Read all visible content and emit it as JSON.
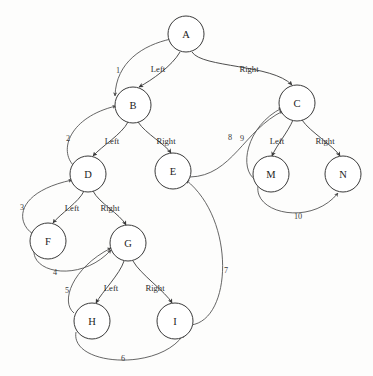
{
  "diagram": {
    "type": "binary-tree-traversal",
    "radius": 18,
    "nodes": [
      {
        "id": "A",
        "label": "A",
        "x": 186,
        "y": 34
      },
      {
        "id": "B",
        "label": "B",
        "x": 133,
        "y": 105
      },
      {
        "id": "C",
        "label": "C",
        "x": 297,
        "y": 103
      },
      {
        "id": "D",
        "label": "D",
        "x": 88,
        "y": 174
      },
      {
        "id": "E",
        "label": "E",
        "x": 173,
        "y": 171
      },
      {
        "id": "M",
        "label": "M",
        "x": 271,
        "y": 174
      },
      {
        "id": "N",
        "label": "N",
        "x": 343,
        "y": 174
      },
      {
        "id": "F",
        "label": "F",
        "x": 48,
        "y": 241
      },
      {
        "id": "G",
        "label": "G",
        "x": 128,
        "y": 243
      },
      {
        "id": "H",
        "label": "H",
        "x": 92,
        "y": 321
      },
      {
        "id": "I",
        "label": "I",
        "x": 175,
        "y": 321
      }
    ],
    "child_edges": [
      {
        "from": "A",
        "to": "B",
        "label": "Left",
        "label_x": 158,
        "label_y": 69,
        "path": "M 180 52 C 172 66 152 80 139 87"
      },
      {
        "from": "A",
        "to": "C",
        "label": "Right",
        "label_x": 249,
        "label_y": 69,
        "path": "M 192 52 C 202 68 272 64 292 85"
      },
      {
        "from": "B",
        "to": "D",
        "label": "Left",
        "label_x": 112,
        "label_y": 141,
        "path": "M 128 122 C 122 134 102 146 93 156"
      },
      {
        "from": "B",
        "to": "E",
        "label": "Right",
        "label_x": 166,
        "label_y": 141,
        "path": "M 138 122 C 146 134 165 144 171 153"
      },
      {
        "from": "C",
        "to": "M",
        "label": "Left",
        "label_x": 277,
        "label_y": 141,
        "path": "M 293 120 C 288 132 276 146 272 156"
      },
      {
        "from": "C",
        "to": "N",
        "label": "Right",
        "label_x": 325,
        "label_y": 141,
        "path": "M 302 120 C 310 132 334 146 340 156"
      },
      {
        "from": "D",
        "to": "F",
        "label": "Left",
        "label_x": 72,
        "label_y": 208,
        "path": "M 84 191 C 79 202 60 214 53 223"
      },
      {
        "from": "D",
        "to": "G",
        "label": "Right",
        "label_x": 110,
        "label_y": 208,
        "path": "M 93 191 C 99 203 120 214 126 225"
      },
      {
        "from": "G",
        "to": "H",
        "label": "Left",
        "label_x": 111,
        "label_y": 288,
        "path": "M 124 261 C 120 274 102 292 96 303"
      },
      {
        "from": "G",
        "to": "I",
        "label": "Right",
        "label_x": 155,
        "label_y": 288,
        "path": "M 133 261 C 140 274 166 292 172 303"
      }
    ],
    "traversal_edges": [
      {
        "number": "1",
        "from": "A",
        "to": "B",
        "label_x": 118,
        "label_y": 70,
        "path": "M 171 39 C 143 45 116 62 115 96"
      },
      {
        "number": "2",
        "from": "D",
        "to": "B",
        "label_x": 68,
        "label_y": 138,
        "path": "M 74 166 C 58 150 70 117 116 106"
      },
      {
        "number": "3",
        "from": "F",
        "to": "D",
        "label_x": 22,
        "label_y": 207,
        "path": "M 33 234 C 15 222 16 192 72 180"
      },
      {
        "number": "4",
        "from": "F",
        "to": "G",
        "label_x": 55,
        "label_y": 272,
        "path": "M 34 250 C 32 274 82 282 111 250"
      },
      {
        "number": "5",
        "from": "H",
        "to": "G",
        "label_x": 67,
        "label_y": 290,
        "path": "M 74 313 C 60 302 72 268 111 248"
      },
      {
        "number": "6",
        "from": "H",
        "to": "I",
        "label_x": 123,
        "label_y": 358,
        "path": "M 76 332 C 70 366 160 372 184 334"
      },
      {
        "number": "7",
        "from": "I",
        "to": "E",
        "label_x": 226,
        "label_y": 270,
        "path": "M 191 325 C 232 320 236 220 186 180"
      },
      {
        "number": "8",
        "from": "E",
        "to": "C",
        "label_x": 230,
        "label_y": 137,
        "path": "M 190 177 C 232 176 244 130 283 111"
      },
      {
        "number": "9",
        "from": "M",
        "to": "C",
        "label_x": 242,
        "label_y": 138,
        "path": "M 256 180 C 238 170 246 126 282 108"
      },
      {
        "number": "10",
        "from": "M",
        "to": "N",
        "label_x": 298,
        "label_y": 216,
        "path": "M 258 186 C 254 214 312 226 338 193"
      }
    ]
  }
}
